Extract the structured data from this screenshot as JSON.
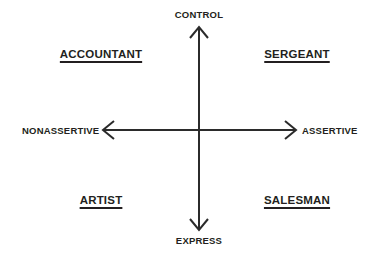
{
  "diagram": {
    "background_color": "#ffffff",
    "line_color": "#2b2b2b",
    "text_color": "#231f20",
    "center": {
      "x": 199,
      "y": 130
    },
    "axes": {
      "vertical": {
        "top_label": "CONTROL",
        "bottom_label": "EXPRESS",
        "top_point": {
          "x": 199,
          "y": 27
        },
        "bottom_point": {
          "x": 199,
          "y": 230
        }
      },
      "horizontal": {
        "left_label": "NONASSERTIVE",
        "right_label": "ASSERTIVE",
        "left_point": {
          "x": 103,
          "y": 130
        },
        "right_point": {
          "x": 296,
          "y": 130
        }
      }
    },
    "quadrants": [
      {
        "key": "top_left",
        "label": "ACCOUNTANT",
        "underlined": true,
        "x_axis": "NONASSERTIVE",
        "y_axis": "CONTROL"
      },
      {
        "key": "top_right",
        "label": "SERGEANT",
        "underlined": true,
        "x_axis": "ASSERTIVE",
        "y_axis": "CONTROL"
      },
      {
        "key": "bottom_left",
        "label": "ARTIST",
        "underlined": true,
        "x_axis": "NONASSERTIVE",
        "y_axis": "EXPRESS"
      },
      {
        "key": "bottom_right",
        "label": "SALESMAN",
        "underlined": true,
        "x_axis": "ASSERTIVE",
        "y_axis": "EXPRESS"
      }
    ],
    "icons": {
      "arrow_up": "arrow-up-icon",
      "arrow_down": "arrow-down-icon",
      "arrow_left": "arrow-left-icon",
      "arrow_right": "arrow-right-icon"
    }
  }
}
